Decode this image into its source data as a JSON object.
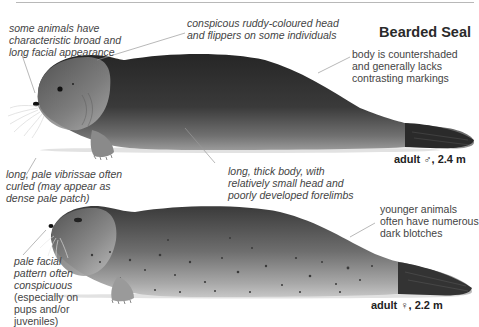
{
  "title": "Bearded Seal",
  "annotations": {
    "facial_appearance": [
      "some animals have",
      "characteristic broad and",
      "long facial appearance"
    ],
    "ruddy_head": [
      "conspicous ruddy-coloured head",
      "and flippers on some individuals"
    ],
    "countershaded": [
      "body is countershaded",
      "and generally lacks",
      "contrasting markings"
    ],
    "vibrissae": [
      "long, pale vibrissae often",
      "curled (may appear as",
      "dense pale patch)"
    ],
    "thick_body": [
      "long, thick body, with",
      "relatively small head and",
      "poorly developed forelimbs"
    ],
    "younger_animals": [
      "younger animals",
      "often have numerous",
      "dark blotches"
    ],
    "pale_facial": {
      "italic": [
        "pale facial",
        "pattern often",
        "conspicuous"
      ],
      "regular": [
        "(especially on",
        "pups and/or",
        "juveniles)"
      ]
    }
  },
  "captions": {
    "male": "adult ♂, 2.4 m",
    "female": "adult ♀, 2.2 m"
  },
  "colors": {
    "body_dark": "#2e2e2e",
    "body_mid": "#6b6b6b",
    "belly_light": "#bdbdbd",
    "leader_line": "#9a9a9a",
    "text": "#444444"
  }
}
